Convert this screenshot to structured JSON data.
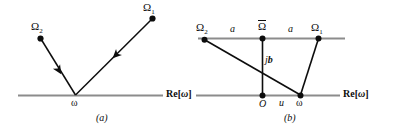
{
  "figure": {
    "colors": {
      "axis": "#8c8c8c",
      "vector": "#0d0d0d",
      "node": "#0d0d0d",
      "background": "#ffffff",
      "text": "#0d0d0d"
    },
    "panels": [
      {
        "id": "a",
        "caption": "(a)",
        "axis_label": "Re[",
        "axis_label_symbol": "ω",
        "axis_label_close": "]",
        "nodes": [
          {
            "name": "omega-2-node",
            "label_base": "Ω",
            "label_sub": "2"
          },
          {
            "name": "omega-1-node",
            "label_base": "Ω",
            "label_sub": "1"
          },
          {
            "name": "omega-vertex-node",
            "label_base": "ω",
            "label_sub": ""
          }
        ],
        "vectors": [
          {
            "name": "vector-omega2-to-omega",
            "from": "Ω₂",
            "to": "ω",
            "arrow": "mid"
          },
          {
            "name": "vector-omega1-to-omega",
            "from": "Ω₁",
            "to": "ω",
            "arrow": "mid"
          }
        ]
      },
      {
        "id": "b",
        "caption": "(b)",
        "axis_label": "Re[",
        "axis_label_symbol": "ω",
        "axis_label_close": "]",
        "nodes": [
          {
            "name": "omega-2-node",
            "label_base": "Ω",
            "label_sub": "2"
          },
          {
            "name": "omega-bar-node",
            "label_base": "Ω",
            "label_sub": "",
            "overline": true
          },
          {
            "name": "omega-1-node",
            "label_base": "Ω",
            "label_sub": "1"
          },
          {
            "name": "origin-node",
            "label_base": "O",
            "label_sub": ""
          },
          {
            "name": "omega-node",
            "label_base": "ω",
            "label_sub": ""
          }
        ],
        "segment_labels": [
          {
            "name": "segment-label-a-left",
            "text": "a"
          },
          {
            "name": "segment-label-a-right",
            "text": "a"
          },
          {
            "name": "segment-label-jb",
            "text_j": "j",
            "text_b": "b"
          },
          {
            "name": "segment-label-u",
            "text": "u"
          }
        ]
      }
    ]
  }
}
